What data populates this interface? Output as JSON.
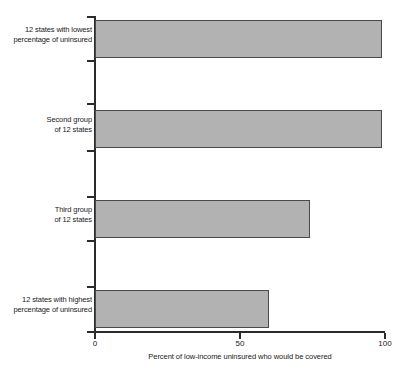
{
  "chart_data": {
    "type": "bar",
    "orientation": "horizontal",
    "title": "",
    "xlabel": "Percent of low-income uninsured who would be covered",
    "ylabel": "",
    "xlim": [
      0,
      100
    ],
    "grid": false,
    "legend": null,
    "categories": [
      "12 states with lowest percentage of uninsured",
      "Second group of 12 states",
      "Third group of 12 states",
      "12 states with highest percentage of uninsured"
    ],
    "values": [
      99,
      99,
      74,
      60
    ],
    "xticks": [
      0,
      50,
      100
    ],
    "xticklabels": [
      "0",
      "50",
      "100"
    ],
    "bar_color": "#b2b2b2",
    "bar_border_color": "#4a4a4a",
    "axis_color": "#2b2b2b"
  },
  "categories": [
    {
      "line1": "12 states with lowest",
      "line2": "percentage of uninsured"
    },
    {
      "line1": "Second group",
      "line2": "of 12 states"
    },
    {
      "line1": "Third group",
      "line2": "of 12 states"
    },
    {
      "line1": "12 states with highest",
      "line2": "percentage of uninsured"
    }
  ],
  "xticklabels": {
    "t0": "0",
    "t50": "50",
    "t100": "100"
  },
  "axis": {
    "xtitle": "Percent of low-income uninsured who would be covered"
  }
}
